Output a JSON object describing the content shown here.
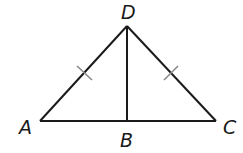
{
  "diagram": {
    "type": "triangle-with-altitude",
    "stroke_color": "#1a1a1a",
    "tick_color": "#8a8a8a",
    "points": {
      "A": {
        "label": "A",
        "x": 40,
        "y": 121
      },
      "B": {
        "label": "B",
        "x": 127,
        "y": 121
      },
      "C": {
        "label": "C",
        "x": 216,
        "y": 121
      },
      "D": {
        "label": "D",
        "x": 127,
        "y": 26
      }
    },
    "segments": [
      "AD",
      "DC",
      "AC",
      "DB"
    ],
    "congruence_marks": [
      {
        "segment": "AD",
        "ticks": 1
      },
      {
        "segment": "DC",
        "ticks": 1
      }
    ]
  }
}
